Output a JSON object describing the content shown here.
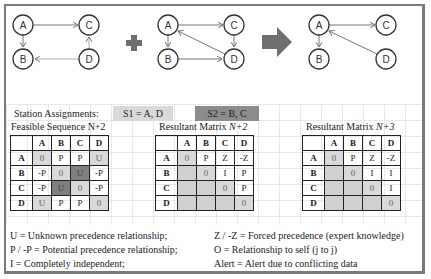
{
  "diagrams": {
    "graph1": {
      "nodes": [
        "A",
        "B",
        "C",
        "D"
      ],
      "edges": [
        [
          "A",
          "C"
        ],
        [
          "A",
          "B"
        ],
        [
          "D",
          "C"
        ],
        [
          "D",
          "B"
        ]
      ]
    },
    "operator_plus": "+",
    "graph2": {
      "nodes": [
        "A",
        "B",
        "C",
        "D"
      ],
      "edges": [
        [
          "A",
          "C"
        ],
        [
          "A",
          "B"
        ],
        [
          "C",
          "D"
        ],
        [
          "B",
          "D"
        ],
        [
          "D",
          "A"
        ]
      ]
    },
    "operator_arrow": "⇒",
    "graph3": {
      "nodes": [
        "A",
        "B",
        "C",
        "D"
      ],
      "edges": [
        [
          "A",
          "C"
        ],
        [
          "A",
          "B"
        ],
        [
          "D",
          "A"
        ]
      ]
    },
    "colors": {
      "plus": "#6f6f6f",
      "arrow": "#6f6f6f",
      "node_stroke": "#333333",
      "edge": "#777777"
    }
  },
  "station": {
    "label": "Station Assignments:",
    "s1": "S1 = A, D",
    "s2": "S2 = B, C",
    "s1_color": "#d9d9d9",
    "s2_color": "#8c8c8c"
  },
  "matrices": [
    {
      "title": "Feasible Sequence N+2",
      "headers": [
        "A",
        "B",
        "C",
        "D"
      ],
      "rows": [
        {
          "label": "A",
          "cells": [
            "0",
            "P",
            "P",
            "U"
          ]
        },
        {
          "label": "B",
          "cells": [
            "-P",
            "0",
            "U",
            "-P"
          ]
        },
        {
          "label": "C",
          "cells": [
            "-P",
            "U",
            "0",
            "-P"
          ]
        },
        {
          "label": "D",
          "cells": [
            "U",
            "P",
            "P",
            "0"
          ]
        }
      ]
    },
    {
      "title": "Resultant Matrix ",
      "title_italic": "N+2",
      "headers": [
        "A",
        "B",
        "C",
        "D"
      ],
      "rows": [
        {
          "label": "A",
          "cells": [
            "0",
            "P",
            "Z",
            "-Z"
          ]
        },
        {
          "label": "B",
          "cells": [
            "",
            "0",
            "I",
            "P"
          ]
        },
        {
          "label": "C",
          "cells": [
            "",
            "",
            "0",
            "P"
          ]
        },
        {
          "label": "D",
          "cells": [
            "",
            "",
            "",
            "0"
          ]
        }
      ]
    },
    {
      "title": "Resultant Matrix ",
      "title_italic": "N+3",
      "headers": [
        "A",
        "B",
        "C",
        "D"
      ],
      "rows": [
        {
          "label": "A",
          "cells": [
            "0",
            "P",
            "Z",
            "-Z"
          ]
        },
        {
          "label": "B",
          "cells": [
            "",
            "0",
            "I",
            "I"
          ]
        },
        {
          "label": "C",
          "cells": [
            "",
            "",
            "0",
            "I"
          ]
        },
        {
          "label": "D",
          "cells": [
            "",
            "",
            "",
            "0"
          ]
        }
      ]
    }
  ],
  "legend": {
    "left": [
      "U = Unknown precedence relationship;",
      "P / -P = Potential  precedence relationship;",
      "I = Completely  independent;"
    ],
    "right": [
      "Z / -Z = Forced precedence (expert knowledge)",
      "O = Relationship  to self (j to j)",
      "Alert  = Alert  due to conflicting  data"
    ]
  }
}
